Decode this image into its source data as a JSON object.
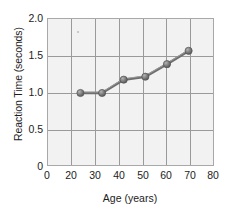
{
  "chart_data": {
    "type": "line",
    "title": "",
    "xlabel": "Age (years)",
    "ylabel": "Reaction Time (seconds)",
    "xlim": [
      0,
      85
    ],
    "ylim": [
      0,
      2.0
    ],
    "grid": true,
    "legend": null,
    "xticks": [
      "0",
      "20",
      "30",
      "40",
      "50",
      "60",
      "70",
      "80"
    ],
    "xtick_values": [
      0,
      20,
      30,
      40,
      50,
      60,
      70,
      80
    ],
    "yticks": [
      "0",
      "0.5",
      "1.0",
      "1.5",
      "2.0"
    ],
    "ytick_values": [
      0,
      0.5,
      1.0,
      1.5,
      2.0
    ],
    "series": [
      {
        "name": "Reaction Time",
        "marker": "circle",
        "color": "#6e6e6e",
        "x": [
          25,
          35,
          45,
          55,
          65,
          75
        ],
        "values": [
          1.0,
          1.0,
          1.18,
          1.22,
          1.39,
          1.57
        ]
      }
    ]
  },
  "colors": {
    "plot_background": "#f2f2f2",
    "grid": "#9a9a9a",
    "frame": "#a8a8a8",
    "line": "#6e6e6e",
    "marker": "#777777",
    "text": "#1c1c1c"
  }
}
